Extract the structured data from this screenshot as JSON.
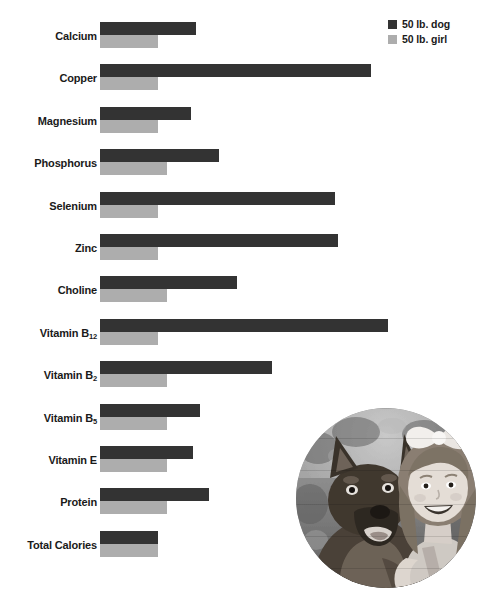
{
  "chart_data": {
    "type": "bar",
    "orientation": "horizontal",
    "title": "",
    "xlabel": "",
    "ylabel": "",
    "grid": false,
    "legend_position": "top-right",
    "axis_note": "Bars are unlabeled; lengths read off pixel extents relative to a common left origin.",
    "categories": [
      "Calcium",
      "Copper",
      "Magnesium",
      "Phosphorus",
      "Selenium",
      "Zinc",
      "Choline",
      "Vitamin B12",
      "Vitamin B2",
      "Vitamin B5",
      "Vitamin E",
      "Protein",
      "Total Calories"
    ],
    "series": [
      {
        "name": "50 lb. dog",
        "color": "#333333",
        "values": [
          96,
          271,
          91,
          119,
          235,
          238,
          137,
          288,
          172,
          100,
          93,
          109,
          58
        ]
      },
      {
        "name": "50 lb. girl",
        "color": "#adadad",
        "values": [
          58,
          58,
          58,
          67,
          58,
          58,
          67,
          58,
          67,
          67,
          67,
          67,
          58
        ]
      }
    ]
  },
  "legend": {
    "items": [
      {
        "label": "50 lb. dog",
        "color": "#333333",
        "swatch_name": "legend-swatch-dog"
      },
      {
        "label": "50 lb. girl",
        "color": "#adadad",
        "swatch_name": "legend-swatch-girl"
      }
    ]
  },
  "labels": {
    "calcium": "Calcium",
    "copper": "Copper",
    "magnesium": "Magnesium",
    "phosphorus": "Phosphorus",
    "selenium": "Selenium",
    "zinc": "Zinc",
    "choline": "Choline",
    "vitamin_b12_main": "Vitamin B",
    "vitamin_b12_sub": "12",
    "vitamin_b2_main": "Vitamin B",
    "vitamin_b2_sub": "2",
    "vitamin_b5_main": "Vitamin B",
    "vitamin_b5_sub": "5",
    "vitamin_e": "Vitamin E",
    "protein": "Protein",
    "total_calories": "Total Calories"
  },
  "photo": {
    "alt": "Grayscale circular photograph of a German Shepherd dog beside a smiling girl wearing a hair bow"
  },
  "colors": {
    "dog_bar": "#333333",
    "girl_bar": "#adadad",
    "text": "#1a1a1a",
    "background": "#ffffff"
  }
}
